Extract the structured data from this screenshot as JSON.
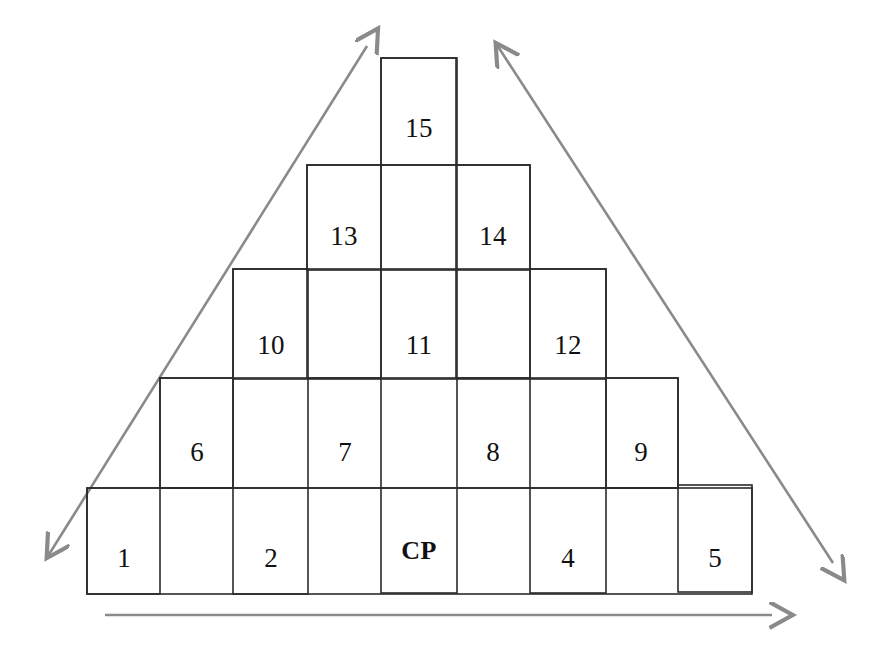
{
  "diagram": {
    "canvas": {
      "width": 874,
      "height": 662
    },
    "colors": {
      "cell_stroke": "#2b2b2b",
      "axis_stroke": "#8a8a8a",
      "background": "#ffffff",
      "text": "#111111"
    },
    "cells": [
      {
        "id": "cell-1",
        "label": "1",
        "x": 87,
        "y": 488,
        "w": 73,
        "h": 106,
        "label_x": 124,
        "label_y": 558,
        "bold": false
      },
      {
        "id": "cell-2",
        "label": "2",
        "x": 233,
        "y": 488,
        "w": 75,
        "h": 106,
        "label_x": 271,
        "label_y": 558,
        "bold": false
      },
      {
        "id": "cell-cp",
        "label": "CP",
        "x": 381,
        "y": 486,
        "w": 76,
        "h": 107,
        "label_x": 419,
        "label_y": 551,
        "bold": true
      },
      {
        "id": "cell-4",
        "label": "4",
        "x": 530,
        "y": 487,
        "w": 76,
        "h": 106,
        "label_x": 568,
        "label_y": 558,
        "bold": false
      },
      {
        "id": "cell-5",
        "label": "5",
        "x": 678,
        "y": 485,
        "w": 74,
        "h": 107,
        "label_x": 715,
        "label_y": 558,
        "bold": false
      },
      {
        "id": "cell-6",
        "label": "6",
        "x": 160,
        "y": 378,
        "w": 73,
        "h": 110,
        "label_x": 197,
        "label_y": 452,
        "bold": false
      },
      {
        "id": "cell-7",
        "label": "7",
        "x": 308,
        "y": 378,
        "w": 73,
        "h": 110,
        "label_x": 345,
        "label_y": 452,
        "bold": false
      },
      {
        "id": "cell-8",
        "label": "8",
        "x": 457,
        "y": 378,
        "w": 73,
        "h": 110,
        "label_x": 493,
        "label_y": 452,
        "bold": false
      },
      {
        "id": "cell-9",
        "label": "9",
        "x": 606,
        "y": 378,
        "w": 72,
        "h": 110,
        "label_x": 641,
        "label_y": 452,
        "bold": false
      },
      {
        "id": "cell-10",
        "label": "10",
        "x": 233,
        "y": 269,
        "w": 75,
        "h": 110,
        "label_x": 271,
        "label_y": 345,
        "bold": false
      },
      {
        "id": "cell-11",
        "label": "11",
        "x": 381,
        "y": 269,
        "w": 76,
        "h": 110,
        "label_x": 419,
        "label_y": 345,
        "bold": false
      },
      {
        "id": "cell-12",
        "label": "12",
        "x": 530,
        "y": 269,
        "w": 76,
        "h": 110,
        "label_x": 568,
        "label_y": 345,
        "bold": false
      },
      {
        "id": "cell-13",
        "label": "13",
        "x": 307,
        "y": 165,
        "w": 74,
        "h": 105,
        "label_x": 344,
        "label_y": 236,
        "bold": false
      },
      {
        "id": "cell-14",
        "label": "14",
        "x": 456,
        "y": 165,
        "w": 74,
        "h": 105,
        "label_x": 493,
        "label_y": 236,
        "bold": false
      },
      {
        "id": "cell-15",
        "label": "15",
        "x": 381,
        "y": 58,
        "w": 75,
        "h": 107,
        "label_x": 419,
        "label_y": 128,
        "bold": false
      }
    ],
    "row_rects": [
      {
        "id": "row-rect-bottom",
        "x": 87,
        "y": 488,
        "w": 665,
        "h": 106
      },
      {
        "id": "row-rect-2",
        "x": 160,
        "y": 378,
        "w": 518,
        "h": 110
      },
      {
        "id": "row-rect-3",
        "x": 233,
        "y": 269,
        "w": 373,
        "h": 110
      },
      {
        "id": "row-rect-4",
        "x": 307,
        "y": 165,
        "w": 223,
        "h": 105
      },
      {
        "id": "row-rect-top",
        "x": 381,
        "y": 58,
        "w": 75,
        "h": 107
      }
    ],
    "column_rects": [
      {
        "id": "col-rect-1",
        "x": 87,
        "y": 488,
        "w": 73,
        "h": 106
      },
      {
        "id": "col-rect-2",
        "x": 233,
        "y": 269,
        "w": 75,
        "h": 325
      },
      {
        "id": "col-rect-center",
        "x": 381,
        "y": 58,
        "w": 76,
        "h": 535
      },
      {
        "id": "col-rect-4",
        "x": 530,
        "y": 269,
        "w": 76,
        "h": 324
      },
      {
        "id": "col-rect-5",
        "x": 678,
        "y": 485,
        "w": 74,
        "h": 107
      },
      {
        "id": "col-rect-6",
        "x": 160,
        "y": 378,
        "w": 73,
        "h": 110
      },
      {
        "id": "col-rect-9",
        "x": 606,
        "y": 378,
        "w": 72,
        "h": 110
      },
      {
        "id": "col-rect-13",
        "x": 307,
        "y": 165,
        "w": 74,
        "h": 213
      },
      {
        "id": "col-rect-14",
        "x": 456,
        "y": 165,
        "w": 74,
        "h": 213
      }
    ],
    "axes": [
      {
        "id": "axis-left-diagonal",
        "name": "left-diagonal-axis",
        "description": "double-headed diagonal axis from lower-left to upper-right",
        "x1": 48,
        "y1": 556,
        "x2": 367,
        "y2": 46,
        "arrow_start": true,
        "arrow_end": true
      },
      {
        "id": "axis-right-diagonal",
        "name": "right-diagonal-axis",
        "description": "double-headed diagonal axis from upper-left to lower-right",
        "x1": 497,
        "y1": 45,
        "x2": 833,
        "y2": 563,
        "arrow_start": true,
        "arrow_end": true
      },
      {
        "id": "axis-horizontal",
        "name": "horizontal-axis",
        "description": "horizontal axis along the base pointing right",
        "x1": 105,
        "y1": 615,
        "x2": 772,
        "y2": 615,
        "arrow_start": false,
        "arrow_end": true
      }
    ]
  }
}
